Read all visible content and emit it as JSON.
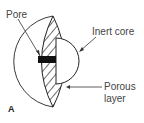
{
  "diagram": {
    "panel_label": "A",
    "labels": {
      "pore": "Pore",
      "inert_core": "Inert core",
      "porous_layer_line1": "Porous",
      "porous_layer_line2": "layer"
    },
    "colors": {
      "stroke": "#222222",
      "pore_fill": "#111111",
      "background": "#ffffff",
      "text": "#444444"
    }
  }
}
